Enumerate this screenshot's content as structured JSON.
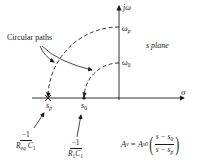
{
  "diagram": {
    "title": "s plane",
    "axes": {
      "vertical_label": "jω",
      "horizontal_label": "σ"
    },
    "annotations": {
      "circular_paths": "Circular paths",
      "omega_p": {
        "base": "ω",
        "sub": "p"
      },
      "omega_0": {
        "base": "ω",
        "sub": "0"
      },
      "s_p": {
        "base": "s",
        "sub": "p"
      },
      "s_0": {
        "base": "s",
        "sub": "0"
      }
    },
    "fractions": {
      "pole": {
        "numerator": "−1",
        "den_R": "R",
        "den_R_sub": "eq",
        "den_C": "C",
        "den_C_sub": "1"
      },
      "zero": {
        "numerator": "−1",
        "den_R": "R",
        "den_R_sub": "1",
        "den_C": "C",
        "den_C_sub": "1"
      }
    },
    "equation": {
      "lhs_base": "A",
      "lhs_sub": "v",
      "equals": " = ",
      "coef_base": "A",
      "coef_sub": "v0",
      "numerator": "s − s",
      "numerator_sub": "0",
      "denominator": "s − s",
      "denominator_sub": "p",
      "open_paren": "(",
      "close_paren": ")"
    },
    "markers": {
      "pole_symbol": "×",
      "zero_symbol": "•"
    },
    "colors": {
      "ink": "#1a1a1a",
      "background": "#ffffff"
    }
  }
}
